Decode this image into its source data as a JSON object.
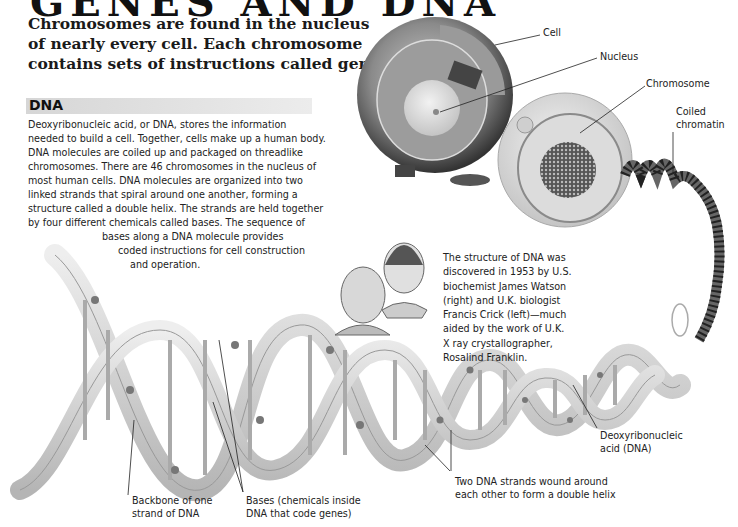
{
  "header": {
    "clipped_title": "GENES AND DNA",
    "intro_lines": [
      "Chromosomes are found in the nucleus",
      "of nearly every cell. Each chromosome",
      "contains sets of instructions called genes."
    ]
  },
  "section": {
    "title": "DNA",
    "bar_color": "#dcdcdc",
    "body_lines": [
      "Deoxyribonucleic acid, or DNA, stores the information",
      "needed to build a cell. Together, cells make up a human body.",
      "DNA molecules are coiled up and packaged on threadlike",
      "chromosomes. There are 46 chromosomes in the nucleus of",
      "most human cells. DNA molecules are organized into two",
      "linked strands that spiral around one another, forming a",
      "structure called a double helix. The strands are held together",
      "by four different chemicals called bases. The sequence of",
      "bases along a DNA molecule provides",
      "coded instructions for cell construction",
      "and operation."
    ]
  },
  "caption": {
    "lines": [
      "The structure of DNA was",
      "discovered in 1953 by U.S.",
      "biochemist James Watson",
      "(right) and U.K. biologist",
      "Francis Crick (left)—much",
      "aided by the work of U.K.",
      "X ray crystallographer,",
      "Rosalind Franklin."
    ]
  },
  "labels": {
    "cell": "Cell",
    "nucleus": "Nucleus",
    "chromosome": "Chromosome",
    "coiled_chromatin": [
      "Coiled",
      "chromatin"
    ],
    "dna": [
      "Deoxyribonucleic",
      "acid (DNA)"
    ],
    "backbone": [
      "Backbone of one",
      "strand of DNA"
    ],
    "bases": [
      "Bases (chemicals inside",
      "DNA that code genes)"
    ],
    "double_helix": [
      "Two DNA strands wound around",
      "each other to form a double helix"
    ]
  }
}
